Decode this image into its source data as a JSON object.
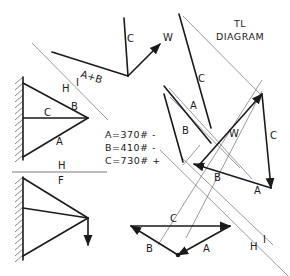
{
  "title": {
    "line1": "TL",
    "line2": "DIAGRAM"
  },
  "forces": {
    "a": "A=370# -",
    "b": "B=410# -",
    "c": "C=730# +"
  },
  "upper_truss": {
    "labels": {
      "b": "B",
      "c": "C",
      "a": "A",
      "h": "H",
      "i": "I"
    }
  },
  "divider": {
    "above": "H",
    "below": "F"
  },
  "space_diagram": {
    "labels": {
      "ab": "A+B",
      "c": "C",
      "w": "W"
    }
  },
  "tl_diagram": {
    "labels": {
      "c_top": "C",
      "a": "A",
      "b": "B",
      "w": "W",
      "c_right": "C",
      "b_bottom": "B",
      "a_bottom": "A",
      "h": "H",
      "i": "I"
    }
  },
  "force_triangle": {
    "labels": {
      "c": "C",
      "b": "B",
      "a": "A"
    }
  },
  "colors": {
    "ink": "#1a1a1a",
    "construction": "#555555",
    "background": "#ffffff"
  }
}
